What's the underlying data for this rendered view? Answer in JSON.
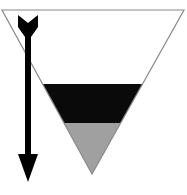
{
  "diagram": {
    "type": "stratified-inverted-triangle-with-arrow",
    "width": 187,
    "height": 195,
    "background": "#ffffff",
    "triangle": {
      "outline_color": "#8a8a8a",
      "top_left": [
        2,
        10
      ],
      "top_right": [
        184,
        10
      ],
      "apex": [
        92,
        174
      ]
    },
    "layers": [
      {
        "name": "empty-upper-region",
        "fill": "#ffffff",
        "y_top": 10,
        "y_bottom": 84
      },
      {
        "name": "black-band",
        "fill": "#0a0a0a",
        "y_top": 84,
        "y_bottom": 123
      },
      {
        "name": "gray-bottom",
        "fill": "#a0a0a0",
        "y_top": 123,
        "y_bottom": 174
      }
    ],
    "arrow": {
      "direction": "down",
      "color": "#000000",
      "x": 28,
      "y_start": 15,
      "y_end": 182
    }
  }
}
